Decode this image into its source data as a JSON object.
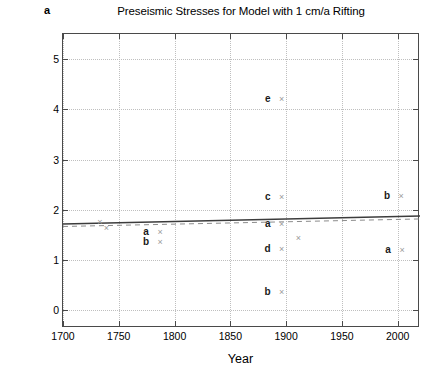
{
  "panel": {
    "label": "a"
  },
  "chart_data": {
    "type": "scatter",
    "title": "Preseismic Stresses for Model with 1 cm/a Rifting",
    "xlabel": "Year",
    "ylabel": "Preseismic shear stress level [MPa]",
    "xlim": [
      1700,
      2020
    ],
    "ylim": [
      -0.35,
      5.5
    ],
    "xticks": [
      1700,
      1750,
      1800,
      1850,
      1900,
      1950,
      2000
    ],
    "xticklabels": [
      "1700",
      "1750",
      "1800",
      "1850",
      "1900",
      "1950",
      "2000"
    ],
    "yticks": [
      0,
      1,
      2,
      3,
      4,
      5
    ],
    "yticklabels": [
      "0",
      "1",
      "2",
      "3",
      "4",
      "5"
    ],
    "grid": true,
    "legend": "none",
    "marker": "x",
    "marker_color": "#9a9a9a",
    "points": [
      {
        "label": "",
        "year": 1733,
        "stress": 1.76
      },
      {
        "label": "",
        "year": 1739,
        "stress": 1.63
      },
      {
        "label": "a",
        "year": 1787,
        "stress": 1.56
      },
      {
        "label": "b",
        "year": 1787,
        "stress": 1.36
      },
      {
        "label": "e",
        "year": 1896,
        "stress": 4.2
      },
      {
        "label": "c",
        "year": 1896,
        "stress": 2.26
      },
      {
        "label": "a",
        "year": 1896,
        "stress": 1.72
      },
      {
        "label": "",
        "year": 1911,
        "stress": 1.45
      },
      {
        "label": "d",
        "year": 1896,
        "stress": 1.22
      },
      {
        "label": "b",
        "year": 1896,
        "stress": 0.37
      },
      {
        "label": "b",
        "year": 2003,
        "stress": 2.27
      },
      {
        "label": "a",
        "year": 2004,
        "stress": 1.21
      }
    ],
    "trend_solid": {
      "x": [
        1700,
        2020
      ],
      "y": [
        1.72,
        1.88
      ],
      "color": "#3c3c3c"
    },
    "trend_dashed": {
      "x": [
        1700,
        2020
      ],
      "y": [
        1.67,
        1.82
      ],
      "color": "#8c8c8c"
    }
  }
}
